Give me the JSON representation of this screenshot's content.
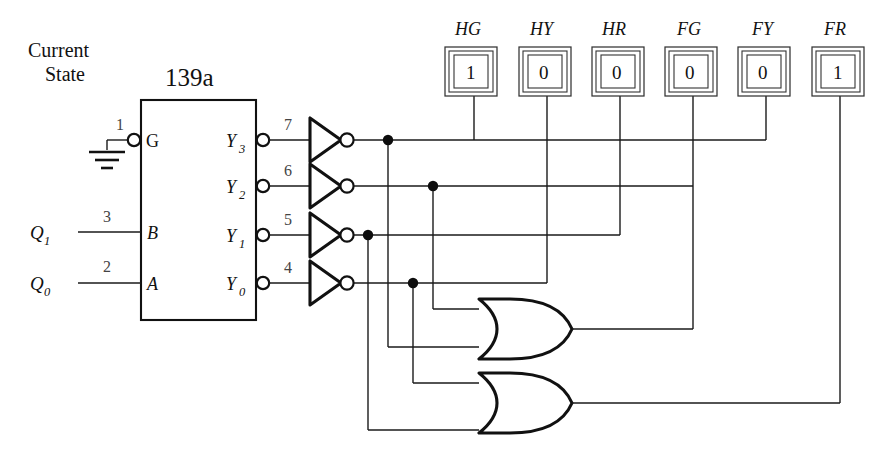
{
  "diagram": {
    "title_label": "Current State",
    "title_line1": "Current",
    "title_line2": "State",
    "chip": {
      "name": "139a",
      "inputs": [
        {
          "pin": "1",
          "port": "G",
          "source": "ground",
          "active_low": true
        },
        {
          "pin": "3",
          "port": "B",
          "source": "Q1",
          "active_low": false
        },
        {
          "pin": "2",
          "port": "A",
          "source": "Q0",
          "active_low": false
        }
      ],
      "outputs": [
        {
          "pin": "7",
          "port": "Y",
          "sub": "3"
        },
        {
          "pin": "6",
          "port": "Y",
          "sub": "2"
        },
        {
          "pin": "5",
          "port": "Y",
          "sub": "1"
        },
        {
          "pin": "4",
          "port": "Y",
          "sub": "0"
        }
      ]
    },
    "state_signals": [
      {
        "name": "Q",
        "sub": "1",
        "pin": "3"
      },
      {
        "name": "Q",
        "sub": "0",
        "pin": "2"
      }
    ],
    "inverters": [
      {
        "input_pin": "7",
        "from": "Y3"
      },
      {
        "input_pin": "6",
        "from": "Y2"
      },
      {
        "input_pin": "5",
        "from": "Y1"
      },
      {
        "input_pin": "4",
        "from": "Y0"
      }
    ],
    "or_gates": [
      {
        "id": "or-upper",
        "label": "",
        "drives": "FG"
      },
      {
        "id": "or-lower",
        "label": "",
        "drives": "FR"
      }
    ],
    "leds": [
      {
        "label": "HG",
        "value": "1"
      },
      {
        "label": "HY",
        "value": "0"
      },
      {
        "label": "HR",
        "value": "0"
      },
      {
        "label": "FG",
        "value": "0"
      },
      {
        "label": "FY",
        "value": "0"
      },
      {
        "label": "FR",
        "value": "1"
      }
    ],
    "ground_label": "",
    "colors": {
      "line": "#1a1a1a",
      "box": "#111111",
      "led_border": "#333333",
      "pin_number": "#444444",
      "background": "#ffffff"
    }
  }
}
